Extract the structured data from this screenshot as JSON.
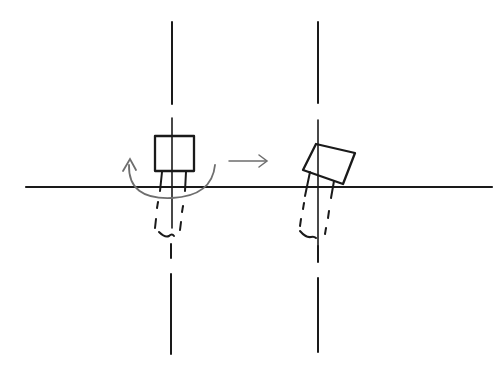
{
  "diagram": {
    "colors": {
      "ink": "#1a1a1a",
      "rotation_arc": "#6e6e6e",
      "background": "#ffffff"
    },
    "ground_line": {
      "x1": 26,
      "y1": 187,
      "x2": 492,
      "y2": 187
    },
    "axes": [
      {
        "name": "left-axis",
        "x": 172,
        "segments": [
          [
            22,
            104
          ],
          [
            118,
            160
          ],
          [
            170,
            228
          ],
          [
            244,
            258
          ],
          [
            274,
            355
          ]
        ]
      },
      {
        "name": "right-axis",
        "x": 318,
        "segments": [
          [
            22,
            103
          ],
          [
            120,
            160
          ],
          [
            170,
            270
          ],
          [
            246,
            262
          ],
          [
            278,
            352
          ]
        ]
      }
    ],
    "states": [
      {
        "name": "upright",
        "label": "",
        "rotation_deg": 0
      },
      {
        "name": "tilted",
        "label": "",
        "rotation_deg": 22
      }
    ],
    "transition_arrow": {
      "glyph": "→",
      "x1": 230,
      "y1": 161,
      "x2": 266,
      "y2": 161
    }
  }
}
